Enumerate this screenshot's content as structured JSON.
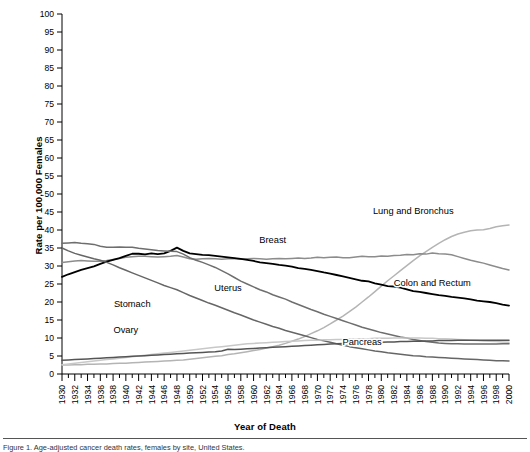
{
  "figure": {
    "xlabel": "Year of Death",
    "ylabel": "Rate per 100,000 Females",
    "caption": "Figure 1. Age-adjusted cancer death rates, females by site, United States."
  },
  "chart_data": {
    "type": "line",
    "title": "",
    "xlabel": "Year of Death",
    "ylabel": "Rate per 100,000 Females",
    "xlim": [
      1930,
      2000
    ],
    "ylim": [
      0,
      100
    ],
    "ytick_step": 5,
    "yticks": [
      0,
      5,
      10,
      15,
      20,
      25,
      30,
      35,
      40,
      45,
      50,
      55,
      60,
      65,
      70,
      75,
      80,
      85,
      90,
      95,
      100
    ],
    "xticks": [
      1930,
      1932,
      1934,
      1936,
      1938,
      1940,
      1942,
      1944,
      1946,
      1948,
      1950,
      1952,
      1954,
      1956,
      1958,
      1960,
      1962,
      1964,
      1966,
      1968,
      1970,
      1972,
      1974,
      1976,
      1978,
      1980,
      1982,
      1984,
      1986,
      1988,
      1990,
      1992,
      1994,
      1996,
      1998,
      2000
    ],
    "xtick_minor_step": 1,
    "grid": false,
    "legend_position": "inline-annotations",
    "x": [
      1930,
      1931,
      1932,
      1933,
      1934,
      1935,
      1936,
      1937,
      1938,
      1939,
      1940,
      1941,
      1942,
      1943,
      1944,
      1945,
      1946,
      1947,
      1948,
      1949,
      1950,
      1951,
      1952,
      1953,
      1954,
      1955,
      1956,
      1957,
      1958,
      1959,
      1960,
      1961,
      1962,
      1963,
      1964,
      1965,
      1966,
      1967,
      1968,
      1969,
      1970,
      1971,
      1972,
      1973,
      1974,
      1975,
      1976,
      1977,
      1978,
      1979,
      1980,
      1981,
      1982,
      1983,
      1984,
      1985,
      1986,
      1987,
      1988,
      1989,
      1990,
      1991,
      1992,
      1993,
      1994,
      1995,
      1996,
      1997,
      1998,
      1999,
      2000
    ],
    "series": [
      {
        "name": "Lung and Bronchus",
        "color": "#b4b4b4",
        "width": 1.5,
        "label_x": 1985,
        "label_y": 44.5,
        "values": [
          2.5,
          2.5,
          2.6,
          2.6,
          2.7,
          2.7,
          2.8,
          2.8,
          2.9,
          3.0,
          3.0,
          3.1,
          3.2,
          3.3,
          3.4,
          3.5,
          3.6,
          3.7,
          3.8,
          3.9,
          4.1,
          4.3,
          4.5,
          4.7,
          4.9,
          5.1,
          5.4,
          5.6,
          5.9,
          6.2,
          6.5,
          6.8,
          7.2,
          7.6,
          8.0,
          8.5,
          9.1,
          9.7,
          10.4,
          11.2,
          12.0,
          12.9,
          13.9,
          15.0,
          16.1,
          17.3,
          18.6,
          20.0,
          21.4,
          22.9,
          24.4,
          25.9,
          27.3,
          28.7,
          30.1,
          31.5,
          32.8,
          34.0,
          35.2,
          36.3,
          37.3,
          38.2,
          38.9,
          39.4,
          39.8,
          40.0,
          40.1,
          40.4,
          40.9,
          41.2,
          41.4
        ]
      },
      {
        "name": "Breast",
        "color": "#8c8c8c",
        "width": 1.5,
        "label_x": 1963,
        "label_y": 36.5,
        "values": [
          31.0,
          31.2,
          31.4,
          31.5,
          31.4,
          31.3,
          31.3,
          31.5,
          31.8,
          32.1,
          32.4,
          32.6,
          32.7,
          32.7,
          32.6,
          32.5,
          32.6,
          32.7,
          32.9,
          32.5,
          32.0,
          31.9,
          32.0,
          32.1,
          32.0,
          31.9,
          32.0,
          32.1,
          31.9,
          32.0,
          32.1,
          32.0,
          31.9,
          32.0,
          32.1,
          32.0,
          32.1,
          32.2,
          32.1,
          32.2,
          32.4,
          32.3,
          32.4,
          32.5,
          32.3,
          32.3,
          32.5,
          32.7,
          32.6,
          32.6,
          32.8,
          32.7,
          32.9,
          33.0,
          33.2,
          33.1,
          33.4,
          33.3,
          33.6,
          33.4,
          33.3,
          33.1,
          32.6,
          32.1,
          31.6,
          31.2,
          30.8,
          30.3,
          29.8,
          29.3,
          28.9
        ]
      },
      {
        "name": "Colon and Rectum",
        "color": "#000000",
        "width": 1.8,
        "label_x": 1988,
        "label_y": 24.5,
        "values": [
          27.0,
          27.7,
          28.3,
          28.9,
          29.4,
          29.9,
          30.6,
          31.2,
          31.7,
          32.2,
          32.8,
          33.4,
          33.4,
          33.2,
          33.5,
          33.3,
          33.5,
          34.2,
          35.1,
          34.2,
          33.5,
          33.3,
          33.1,
          33.0,
          32.8,
          32.6,
          32.4,
          32.2,
          32.0,
          31.7,
          31.4,
          31.0,
          30.8,
          30.6,
          30.3,
          30.1,
          29.8,
          29.4,
          29.2,
          28.9,
          28.6,
          28.2,
          27.9,
          27.5,
          27.1,
          26.7,
          26.3,
          25.9,
          25.7,
          25.2,
          24.8,
          24.4,
          24.3,
          24.0,
          23.5,
          23.0,
          22.8,
          22.5,
          22.2,
          21.9,
          21.7,
          21.4,
          21.2,
          21.0,
          20.7,
          20.4,
          20.2,
          20.0,
          19.7,
          19.3,
          19.0
        ]
      },
      {
        "name": "Uterus",
        "color": "#6e6e6e",
        "width": 1.5,
        "label_x": 1956,
        "label_y": 23.0,
        "values": [
          36.3,
          36.4,
          36.5,
          36.3,
          36.2,
          36.0,
          35.5,
          35.2,
          35.2,
          35.3,
          35.2,
          35.2,
          34.9,
          34.7,
          34.5,
          34.3,
          34.2,
          34.1,
          34.0,
          33.3,
          32.3,
          31.6,
          31.0,
          30.3,
          29.6,
          28.7,
          27.8,
          26.8,
          25.8,
          25.0,
          24.2,
          23.4,
          22.8,
          22.0,
          21.4,
          20.8,
          20.0,
          19.3,
          18.6,
          17.9,
          17.3,
          16.6,
          16.0,
          15.4,
          14.8,
          14.2,
          13.6,
          13.0,
          12.5,
          12.0,
          11.5,
          11.1,
          10.7,
          10.3,
          10.0,
          9.6,
          9.3,
          9.0,
          8.8,
          8.6,
          8.5,
          8.4,
          8.4,
          8.3,
          8.3,
          8.3,
          8.3,
          8.3,
          8.3,
          8.4,
          8.4
        ]
      },
      {
        "name": "Stomach",
        "color": "#666666",
        "width": 1.5,
        "label_x": 1941,
        "label_y": 18.5,
        "values": [
          35.0,
          34.2,
          33.5,
          33.0,
          32.5,
          32.0,
          31.6,
          31.0,
          30.3,
          29.5,
          28.8,
          28.1,
          27.4,
          26.7,
          26.0,
          25.3,
          24.6,
          24.0,
          23.4,
          22.6,
          21.8,
          21.1,
          20.4,
          19.7,
          19.1,
          18.4,
          17.7,
          17.0,
          16.4,
          15.7,
          15.0,
          14.4,
          13.8,
          13.2,
          12.7,
          12.1,
          11.6,
          11.1,
          10.6,
          10.1,
          9.6,
          9.2,
          8.8,
          8.4,
          8.0,
          7.6,
          7.3,
          7.0,
          6.7,
          6.4,
          6.2,
          5.9,
          5.7,
          5.5,
          5.3,
          5.1,
          5.0,
          4.8,
          4.7,
          4.6,
          4.5,
          4.4,
          4.3,
          4.2,
          4.1,
          4.0,
          3.9,
          3.8,
          3.7,
          3.7,
          3.6
        ]
      },
      {
        "name": "Ovary",
        "color": "#c8c8c8",
        "width": 1.5,
        "label_x": 1940,
        "label_y": 11.5,
        "values": [
          2.6,
          2.8,
          3.0,
          3.2,
          3.4,
          3.6,
          3.8,
          4.0,
          4.2,
          4.4,
          4.6,
          4.8,
          5.0,
          5.2,
          5.4,
          5.6,
          5.8,
          6.0,
          6.2,
          6.4,
          6.6,
          6.8,
          7.0,
          7.2,
          7.4,
          7.6,
          7.8,
          8.0,
          8.2,
          8.4,
          8.5,
          8.6,
          8.7,
          8.8,
          8.9,
          9.0,
          9.1,
          9.2,
          9.3,
          9.4,
          9.4,
          9.5,
          9.5,
          9.6,
          9.6,
          9.7,
          9.7,
          9.8,
          9.8,
          9.9,
          9.9,
          9.9,
          10.0,
          10.0,
          10.0,
          10.0,
          10.0,
          9.9,
          9.9,
          9.8,
          9.8,
          9.7,
          9.6,
          9.5,
          9.4,
          9.3,
          9.2,
          9.1,
          9.0,
          8.9,
          8.8
        ]
      },
      {
        "name": "Pancreas",
        "color": "#555555",
        "width": 1.5,
        "label_x": 1977,
        "label_y": 8.0,
        "values": [
          3.8,
          3.9,
          4.0,
          4.1,
          4.2,
          4.3,
          4.4,
          4.5,
          4.6,
          4.7,
          4.8,
          4.9,
          5.0,
          5.1,
          5.2,
          5.3,
          5.4,
          5.5,
          5.6,
          5.7,
          5.8,
          5.9,
          6.0,
          6.1,
          6.2,
          6.4,
          6.9,
          6.8,
          6.9,
          7.0,
          7.1,
          7.2,
          7.3,
          7.4,
          7.5,
          7.6,
          7.7,
          7.8,
          7.9,
          8.0,
          8.1,
          8.2,
          8.3,
          8.4,
          8.5,
          8.5,
          8.6,
          8.7,
          8.7,
          8.8,
          8.8,
          8.9,
          8.9,
          9.0,
          9.0,
          9.1,
          9.1,
          9.2,
          9.2,
          9.3,
          9.3,
          9.3,
          9.4,
          9.4,
          9.4,
          9.4,
          9.4,
          9.4,
          9.4,
          9.4,
          9.4
        ]
      }
    ]
  }
}
